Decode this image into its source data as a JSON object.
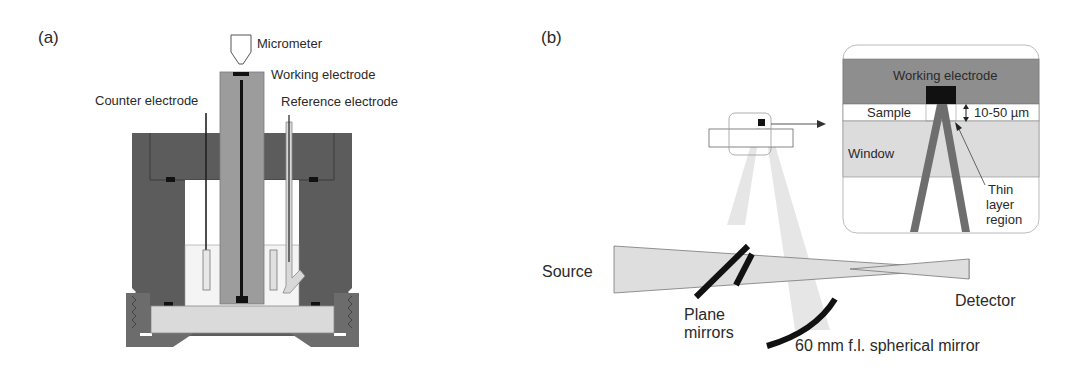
{
  "panels": {
    "a": {
      "label": "(a)",
      "title": "Spectroelectrochemical cell",
      "labels": {
        "micrometer": "Micrometer",
        "working_electrode": "Working electrode",
        "counter_electrode": "Counter electrode",
        "reference_electrode": "Reference electrode"
      }
    },
    "b": {
      "label": "(b)",
      "title": "Optical setup",
      "labels": {
        "source": "Source",
        "detector": "Detector",
        "plane_mirrors_1": "Plane",
        "plane_mirrors_2": "mirrors",
        "spherical_mirror": "60 mm f.l. spherical mirror"
      },
      "inset": {
        "working_electrode": "Working electrode",
        "sample": "Sample",
        "thickness": "10-50 µm",
        "window": "Window",
        "thin_layer_1": "Thin",
        "thin_layer_2": "layer",
        "thin_layer_3": "region"
      }
    }
  },
  "colors": {
    "cell_body": "#5a5a5a",
    "cell_base": "#707070",
    "electrode_holder": "#9a9a9a",
    "window": "#dcdcdc",
    "beam": "#e4e4e4",
    "mirror": "#111111",
    "inset_electrode": "#8c8c8c",
    "inset_beam": "#6e6e6e"
  }
}
